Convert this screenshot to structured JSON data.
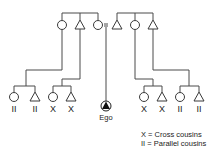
{
  "diagram": {
    "ego_label": "Ego",
    "cousin_labels": {
      "group1": [
        "II",
        "II"
      ],
      "group2": [
        "X",
        "X"
      ],
      "group3": [
        "X",
        "X"
      ],
      "group4": [
        "II",
        "II"
      ]
    },
    "legend": {
      "cross": "X = Cross cousins",
      "parallel": "II = Parallel cousins"
    },
    "symbols": {
      "female": "circle",
      "male": "triangle",
      "ego": "filled-triangle-in-circle",
      "marriage": "equals-sign"
    },
    "colors": {
      "line": "#4a4a4a",
      "ego_fill": "#111111"
    }
  }
}
